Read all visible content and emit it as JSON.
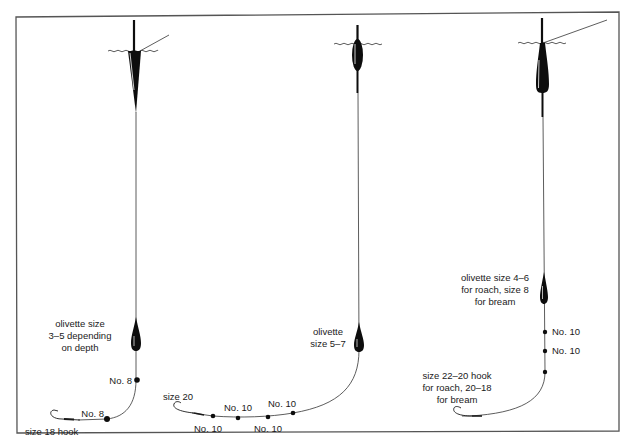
{
  "diagram": {
    "title": "",
    "colors": {
      "line": "#1a1a1a",
      "frame": "#555555",
      "fill": "#0d0d0d",
      "background": "#ffffff"
    },
    "rigs": [
      {
        "id": "rig-1",
        "float_shape": "tapered-dart",
        "olivette_label": [
          "olivette size",
          "3–5 depending",
          "on depth"
        ],
        "shot_labels": [
          "No. 8",
          "No. 8"
        ],
        "hook_label": "size 18 hook"
      },
      {
        "id": "rig-2",
        "float_shape": "oval-bodied",
        "olivette_label": [
          "olivette",
          "size 5–7"
        ],
        "shot_labels": [
          "No. 10",
          "No. 10",
          "No. 10",
          "No. 10"
        ],
        "hook_label": "size 20"
      },
      {
        "id": "rig-3",
        "float_shape": "long-teardrop",
        "olivette_label": [
          "olivette size 4–6",
          "for roach, size 8",
          "for bream"
        ],
        "shot_labels": [
          "No. 10",
          "No. 10"
        ],
        "hook_label": [
          "size 22–20 hook",
          "for roach, 20–18",
          "for bream"
        ]
      }
    ]
  }
}
